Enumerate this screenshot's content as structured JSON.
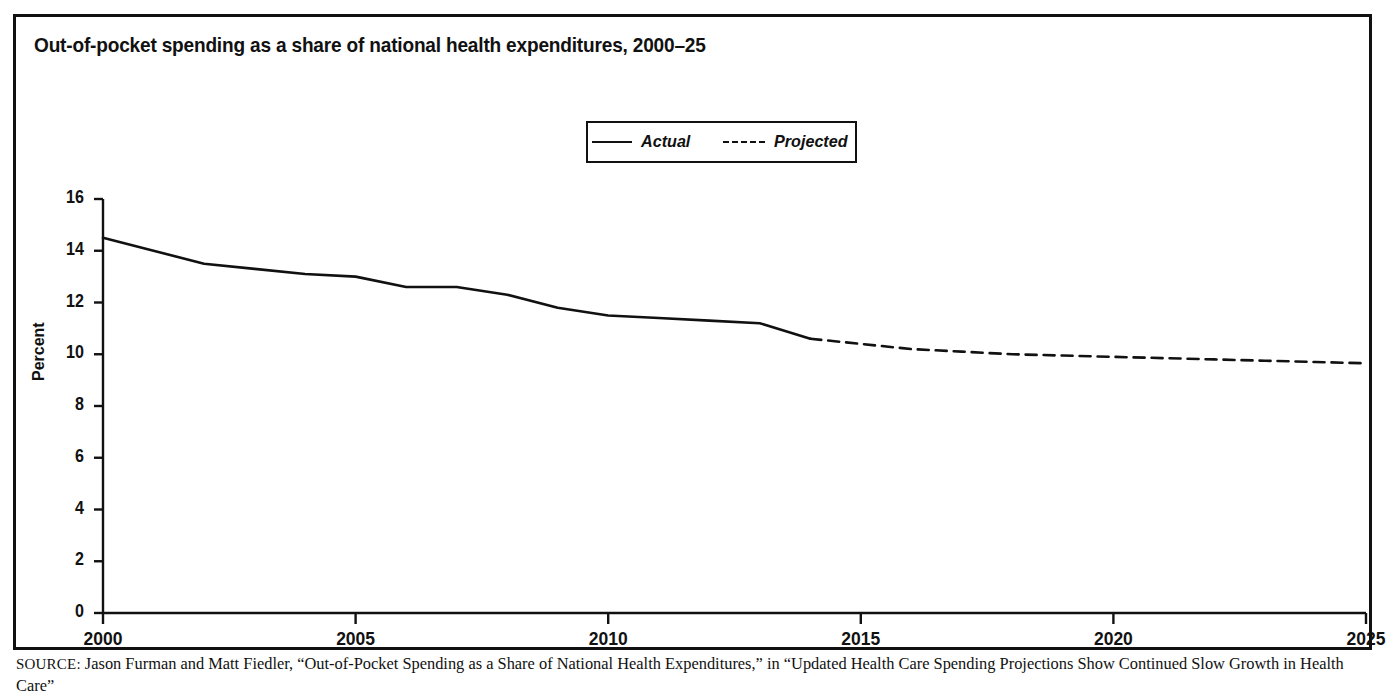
{
  "figure": {
    "title": "Out-of-pocket spending as a share of national health expenditures, 2000–25",
    "source_prefix": "SOURCE:",
    "source_text": " Jason Furman and Matt Fiedler, “Out-of-Pocket Spending as a Share of National Health Expenditures,” in “Updated Health Care Spending Projections Show Continued Slow Growth in Health Care”"
  },
  "legend": {
    "items": [
      {
        "label": "Actual",
        "style": "solid"
      },
      {
        "label": "Projected",
        "style": "dashed"
      }
    ]
  },
  "chart_data": {
    "type": "line",
    "title": "Out-of-pocket spending as a share of national health expenditures, 2000–25",
    "xlabel": "",
    "ylabel": "Percent",
    "xlim": [
      2000,
      2025
    ],
    "ylim": [
      0,
      16
    ],
    "xticks": [
      2000,
      2005,
      2010,
      2015,
      2020,
      2025
    ],
    "xtick_labels": [
      "2000",
      "2005",
      "2010",
      "2015",
      "2020",
      "2025"
    ],
    "yticks": [
      0,
      2,
      4,
      6,
      8,
      10,
      12,
      14,
      16
    ],
    "ytick_labels": [
      "0",
      "2",
      "4",
      "6",
      "8",
      "10",
      "12",
      "14",
      "16"
    ],
    "grid": false,
    "legend_position": "top-center",
    "series": [
      {
        "name": "Actual",
        "style": "solid",
        "x": [
          2000,
          2001,
          2002,
          2003,
          2004,
          2005,
          2006,
          2007,
          2008,
          2009,
          2010,
          2011,
          2012,
          2013,
          2014
        ],
        "values": [
          14.5,
          14.0,
          13.5,
          13.3,
          13.1,
          13.0,
          12.6,
          12.6,
          12.3,
          11.8,
          11.5,
          11.4,
          11.3,
          11.2,
          10.6
        ]
      },
      {
        "name": "Projected",
        "style": "dashed",
        "x": [
          2014,
          2015,
          2016,
          2017,
          2018,
          2019,
          2020,
          2021,
          2022,
          2023,
          2024,
          2025
        ],
        "values": [
          10.6,
          10.4,
          10.2,
          10.1,
          10.0,
          9.95,
          9.9,
          9.85,
          9.8,
          9.75,
          9.7,
          9.65
        ]
      }
    ]
  }
}
